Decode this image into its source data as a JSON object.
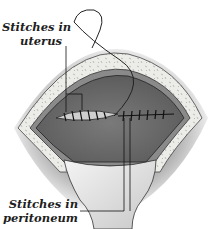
{
  "figure": {
    "labels": {
      "top": {
        "line1": "Stitches in",
        "line2": "uterus"
      },
      "bottom": {
        "line1": "Stitches in",
        "line2": "peritoneum"
      }
    },
    "colors": {
      "skin_shadow": "#9a9a9a",
      "fat_layer": "#e8e8e4",
      "cavity": "#6e6e6e",
      "retractor": "#dcdcdc",
      "line": "#1a1a1a"
    }
  }
}
